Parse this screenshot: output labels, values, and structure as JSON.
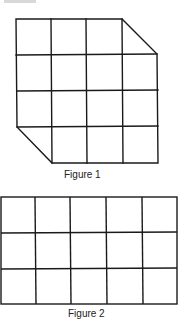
{
  "figures": [
    {
      "caption": "Figure 1",
      "description": "4x4 grid of squares with top-right and bottom-left corner squares cut diagonally",
      "rows": 4,
      "cols": 4
    },
    {
      "caption": "Figure 2",
      "description": "Rectangular grid of 5 columns by 3 rows",
      "rows": 3,
      "cols": 5
    }
  ],
  "colors": {
    "line": "#1a1a1a",
    "background": "#ffffff"
  }
}
